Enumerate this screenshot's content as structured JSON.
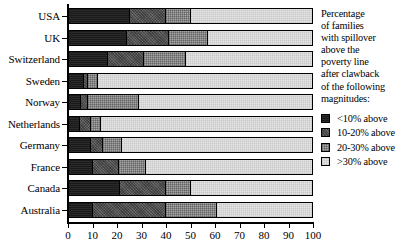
{
  "chart_data": {
    "type": "bar",
    "orientation": "horizontal",
    "stacked": true,
    "title": "",
    "xlabel": "",
    "ylabel": "",
    "xlim": [
      0,
      100
    ],
    "xticks": [
      0,
      10,
      20,
      30,
      40,
      50,
      60,
      70,
      80,
      90,
      100
    ],
    "xticklabels": [
      "0",
      "10",
      "20",
      "30",
      "40",
      "50",
      "60",
      "70",
      "80",
      "90",
      "100"
    ],
    "grid": false,
    "legend_position": "right",
    "categories": [
      "USA",
      "UK",
      "Switzerland",
      "Sweden",
      "Norway",
      "Netherlands",
      "Germany",
      "France",
      "Canada",
      "Australia"
    ],
    "series": [
      {
        "name": "<10% above",
        "color": "#1a1a1a",
        "values": [
          25,
          24,
          16,
          6,
          5,
          4.5,
          9,
          10,
          21,
          10
        ]
      },
      {
        "name": "10-20% above",
        "color": "#575757",
        "values": [
          15,
          17,
          15,
          2,
          3,
          4.5,
          5,
          10.5,
          19,
          30
        ]
      },
      {
        "name": "20-30% above",
        "color": "#a6a6a6",
        "values": [
          10,
          16,
          17,
          4,
          21,
          4,
          8,
          11,
          10,
          21
        ]
      },
      {
        "name": ">30% above",
        "color": "#e4e4e4",
        "values": [
          50,
          43,
          52,
          88,
          71,
          87,
          78,
          68.5,
          50,
          39
        ]
      }
    ]
  },
  "legend": {
    "header_lines": [
      "Percentage",
      "of families",
      "with spillover",
      "above the",
      "poverty line",
      "after clawback",
      "of the following",
      "magnitudes:"
    ],
    "items": [
      {
        "label": "<10% above",
        "swatch": "fill0"
      },
      {
        "label": "10-20% above",
        "swatch": "fill1"
      },
      {
        "label": "20-30% above",
        "swatch": "fill2"
      },
      {
        "label": ">30% above",
        "swatch": "fill3"
      }
    ]
  }
}
